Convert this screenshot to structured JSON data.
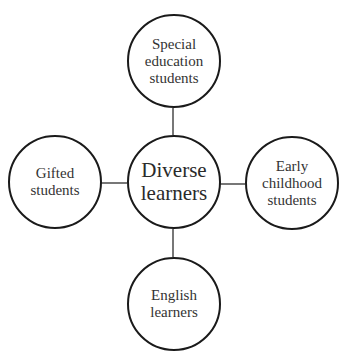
{
  "diagram": {
    "center": {
      "label": "Diverse\nlearners"
    },
    "nodes": {
      "top": {
        "label": "Special\neducation\nstudents"
      },
      "left": {
        "label": "Gifted\nstudents"
      },
      "right": {
        "label": "Early\nchildhood\nstudents"
      },
      "bottom": {
        "label": "English\nlearners"
      }
    },
    "colors": {
      "stroke": "#1a1a1a",
      "connector": "#777777",
      "text": "#333333"
    }
  }
}
